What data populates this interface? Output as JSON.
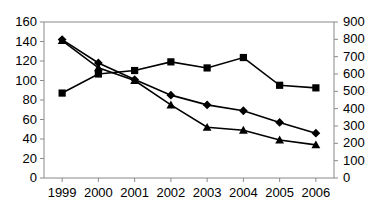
{
  "chart_data": {
    "type": "line",
    "title": "",
    "subtitle": "",
    "xlabel": "",
    "ylabel": "",
    "y2label": "",
    "grid": false,
    "legend_position": "none",
    "categories": [
      "1999",
      "2000",
      "2001",
      "2002",
      "2003",
      "2004",
      "2005",
      "2006"
    ],
    "x": [
      1999,
      2000,
      2001,
      2002,
      2003,
      2004,
      2005,
      2006
    ],
    "ylim": [
      0,
      160
    ],
    "y2lim": [
      0,
      900
    ],
    "yticks": [
      0,
      20,
      40,
      60,
      80,
      100,
      120,
      140,
      160
    ],
    "y2ticks": [
      0,
      100,
      200,
      300,
      400,
      500,
      600,
      700,
      800,
      900
    ],
    "series": [
      {
        "name": "series-diamond",
        "marker": "diamond",
        "axis": "left",
        "color": "#000000",
        "values": [
          142,
          118,
          101,
          85,
          75,
          69,
          57,
          46
        ]
      },
      {
        "name": "series-triangle",
        "marker": "triangle",
        "axis": "left",
        "color": "#000000",
        "values": [
          141,
          113,
          100,
          75,
          52,
          49,
          39,
          34
        ]
      },
      {
        "name": "series-square",
        "marker": "square",
        "axis": "right",
        "color": "#000000",
        "values": [
          490,
          600,
          620,
          670,
          635,
          695,
          535,
          520
        ]
      }
    ]
  },
  "axes": {
    "y_left_ticks": [
      "160",
      "140",
      "120",
      "100",
      "80",
      "60",
      "40",
      "20",
      "0"
    ],
    "y_right_ticks": [
      "900",
      "800",
      "700",
      "600",
      "500",
      "400",
      "300",
      "200",
      "100",
      "0"
    ],
    "x_ticks": [
      "1999",
      "2000",
      "2001",
      "2002",
      "2003",
      "2004",
      "2005",
      "2006"
    ]
  }
}
